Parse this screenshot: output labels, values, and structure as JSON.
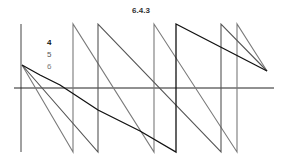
{
  "title": "6.4.3",
  "chart_data": {
    "type": "line",
    "title": "6.4.3",
    "xlabel": "",
    "ylabel": "",
    "grid": false,
    "legend_position": "upper-left-inside",
    "axes": {
      "y_axis_x_px": 21,
      "x_axis_y_px": 88,
      "plot_top_px": 24,
      "plot_bottom_px": 152,
      "plot_left_px": 14,
      "plot_right_px": 274
    },
    "series": [
      {
        "name": "4",
        "color": "#111111",
        "points_px": [
          [
            22,
            65
          ],
          [
            40,
            75
          ],
          [
            60,
            85
          ],
          [
            98,
            110
          ],
          [
            140,
            131
          ],
          [
            176,
            152
          ],
          [
            176,
            24
          ],
          [
            267,
            71
          ]
        ]
      },
      {
        "name": "5",
        "color": "#555555",
        "points_px": [
          [
            22,
            65
          ],
          [
            98,
            152
          ],
          [
            98,
            24
          ],
          [
            221,
            152
          ],
          [
            221,
            24
          ],
          [
            267,
            71
          ]
        ]
      },
      {
        "name": "6",
        "color": "#7a7a7a",
        "points_px": [
          [
            22,
            65
          ],
          [
            73,
            152
          ],
          [
            73,
            24
          ],
          [
            154,
            152
          ],
          [
            154,
            24
          ],
          [
            237,
            152
          ],
          [
            237,
            24
          ],
          [
            267,
            71
          ]
        ]
      }
    ]
  },
  "legend": [
    {
      "label": "4",
      "color": "#111111"
    },
    {
      "label": "5",
      "color": "#555555"
    },
    {
      "label": "6",
      "color": "#7a7a7a"
    }
  ]
}
